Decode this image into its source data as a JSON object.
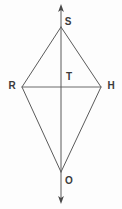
{
  "figure": {
    "kind": "geometry-diagram",
    "background_color": "#fdfdfd",
    "line_color": "#5a5a5a",
    "label_color": "#3b3b3b",
    "canvas": {
      "width": 122,
      "height": 209
    },
    "labels": [
      {
        "id": "S",
        "text": "S",
        "x": 68,
        "y": 22
      },
      {
        "id": "R",
        "text": "R",
        "x": 12,
        "y": 86
      },
      {
        "id": "T",
        "text": "T",
        "x": 69,
        "y": 77
      },
      {
        "id": "H",
        "text": "H",
        "x": 111,
        "y": 86
      },
      {
        "id": "O",
        "text": "O",
        "x": 69,
        "y": 181
      }
    ],
    "points": {
      "S": {
        "x": 61,
        "y": 27
      },
      "R": {
        "x": 22,
        "y": 87
      },
      "T": {
        "x": 61,
        "y": 87
      },
      "H": {
        "x": 101,
        "y": 87
      },
      "O": {
        "x": 61,
        "y": 172
      }
    },
    "segments": [
      {
        "name": "edge-S-R",
        "x1": 61,
        "y1": 27,
        "x2": 22,
        "y2": 87
      },
      {
        "name": "edge-S-H",
        "x1": 61,
        "y1": 27,
        "x2": 101,
        "y2": 87
      },
      {
        "name": "edge-R-O",
        "x1": 22,
        "y1": 87,
        "x2": 61,
        "y2": 172
      },
      {
        "name": "edge-H-O",
        "x1": 101,
        "y1": 87,
        "x2": 61,
        "y2": 172
      },
      {
        "name": "diagonal-R-H",
        "x1": 22,
        "y1": 87,
        "x2": 101,
        "y2": 87
      }
    ],
    "axis_line": {
      "name": "diagonal-S-O-extended",
      "x": 61,
      "y_top": 5,
      "y_bottom": 204,
      "arrow_top": true,
      "arrow_bottom": true
    }
  }
}
